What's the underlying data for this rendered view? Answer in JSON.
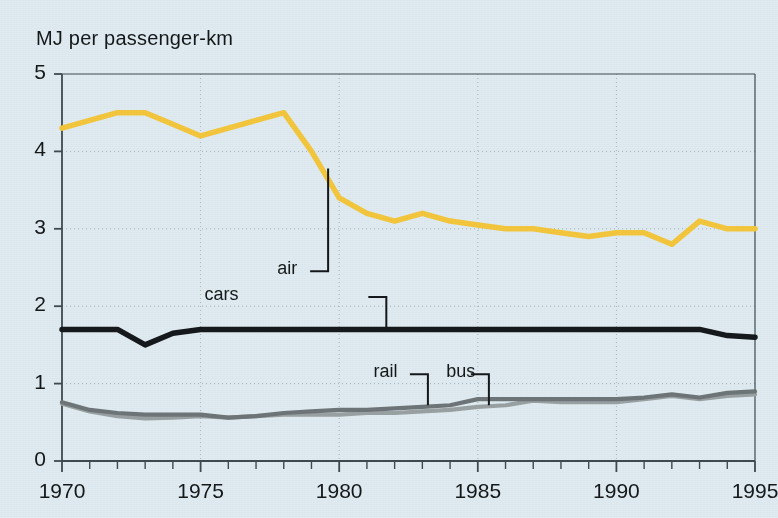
{
  "chart_data": {
    "type": "line",
    "title": "MJ per passenger-km",
    "xlabel": "",
    "ylabel": "MJ per passenger-km",
    "xlim": [
      1970,
      1995
    ],
    "ylim": [
      0,
      5
    ],
    "ytick_labels": [
      "0",
      "1",
      "2",
      "3",
      "4",
      "5"
    ],
    "ytick_values": [
      0,
      1,
      2,
      3,
      4,
      5
    ],
    "xtick_labels": [
      "1970",
      "1975",
      "1980",
      "1985",
      "1990",
      "1995"
    ],
    "xtick_values": [
      1970,
      1975,
      1980,
      1985,
      1990,
      1995
    ],
    "x_minor_tick_interval": 1,
    "grid": "dotted horizontal and vertical gridlines at labelled ticks",
    "legend": "inline callout labels with leader lines",
    "x": [
      1970,
      1971,
      1972,
      1973,
      1974,
      1975,
      1976,
      1977,
      1978,
      1979,
      1980,
      1981,
      1982,
      1983,
      1984,
      1985,
      1986,
      1987,
      1988,
      1989,
      1990,
      1991,
      1992,
      1993,
      1994,
      1995
    ],
    "series": [
      {
        "name": "air",
        "color": "#f3c63c",
        "values": [
          4.3,
          4.4,
          4.5,
          4.5,
          4.35,
          4.2,
          4.3,
          4.4,
          4.5,
          4.0,
          3.4,
          3.2,
          3.1,
          3.2,
          3.1,
          3.05,
          3.0,
          3.0,
          2.95,
          2.9,
          2.95,
          2.95,
          2.8,
          3.1,
          3.0,
          3.0
        ]
      },
      {
        "name": "cars",
        "color": "#15191b",
        "values": [
          1.7,
          1.7,
          1.7,
          1.5,
          1.65,
          1.7,
          1.7,
          1.7,
          1.7,
          1.7,
          1.7,
          1.7,
          1.7,
          1.7,
          1.7,
          1.7,
          1.7,
          1.7,
          1.7,
          1.7,
          1.7,
          1.7,
          1.7,
          1.7,
          1.62,
          1.6
        ]
      },
      {
        "name": "rail",
        "color": "#6e7578",
        "values": [
          0.76,
          0.66,
          0.62,
          0.6,
          0.6,
          0.6,
          0.56,
          0.58,
          0.62,
          0.64,
          0.66,
          0.66,
          0.68,
          0.7,
          0.72,
          0.8,
          0.8,
          0.8,
          0.8,
          0.8,
          0.8,
          0.82,
          0.86,
          0.82,
          0.88,
          0.9
        ]
      },
      {
        "name": "bus",
        "color": "#9aa1a3",
        "values": [
          0.74,
          0.64,
          0.58,
          0.55,
          0.56,
          0.58,
          0.56,
          0.58,
          0.6,
          0.6,
          0.6,
          0.62,
          0.62,
          0.64,
          0.66,
          0.7,
          0.72,
          0.78,
          0.76,
          0.76,
          0.76,
          0.8,
          0.84,
          0.8,
          0.84,
          0.86
        ]
      }
    ],
    "annotations": [
      {
        "label": "air",
        "label_x": 1979.1,
        "label_y": 2.45,
        "point_x": 1979.6,
        "point_y": 3.78
      },
      {
        "label": "cars",
        "label_x": 1976.8,
        "label_y": 2.12,
        "point_x": 1981.7,
        "point_y": 1.72
      },
      {
        "label": "rail",
        "label_x": 1982.9,
        "label_y": 1.12,
        "point_x": 1983.2,
        "point_y": 0.72
      },
      {
        "label": "bus",
        "label_x": 1985.2,
        "label_y": 1.12,
        "point_x": 1985.4,
        "point_y": 0.72
      }
    ],
    "colors": {
      "background": "#dfebf0",
      "axis": "#3d4a50",
      "grid": "#8fa3ac",
      "text": "#14181a",
      "air": "#f3c63c",
      "cars": "#15191b",
      "rail": "#6e7578",
      "bus": "#9aa1a3"
    }
  }
}
